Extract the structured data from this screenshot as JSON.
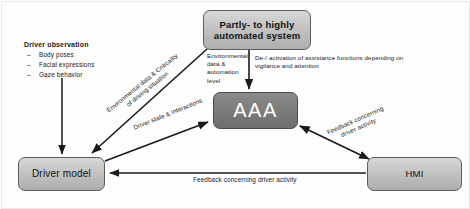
{
  "diagram": {
    "nodes": {
      "automated_system": "Partly- to highly automated system",
      "aaa": "AAA",
      "driver_model": "Driver model",
      "hmi": "HMI"
    },
    "observation_block": {
      "heading": "Driver observation",
      "items": [
        "Body poses",
        "Facial expressions",
        "Gaze behavior"
      ]
    },
    "edge_labels": {
      "env_data_automation_level": "Environmental data & automation level",
      "de_activation": "De-/ activation of assistance functions depending on vigilance and attention",
      "env_data_criticality": "Environmental data & Criticality of driving situation",
      "driver_state_interactions": "Driver state & interactions",
      "feedback_driver_activity_diagonal": "Feedback concerning driver activity",
      "feedback_driver_activity_bottom": "Feedback concerning driver activity"
    },
    "colors": {
      "node_light_fill": "#c2c2c2",
      "node_dark_fill": "#7c7c7c",
      "node_border": "#5d5d5d",
      "arrow": "#1a1a1a",
      "background": "#fdfdfd"
    }
  }
}
